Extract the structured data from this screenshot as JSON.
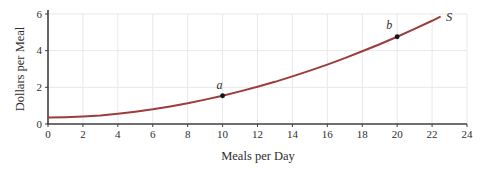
{
  "chart_data": {
    "type": "line",
    "title": "",
    "xlabel": "Meals per Day",
    "ylabel": "Dollars per Meal",
    "xlim": [
      0,
      24
    ],
    "ylim": [
      0,
      6
    ],
    "x_ticks": [
      0,
      2,
      4,
      6,
      8,
      10,
      12,
      14,
      16,
      18,
      20,
      22,
      24
    ],
    "y_ticks": [
      0,
      2,
      4,
      6
    ],
    "grid": true,
    "legend": "none",
    "series": [
      {
        "name": "supply-curve",
        "label": "S",
        "color": "#9c3c3c",
        "points": [
          [
            0,
            0.35
          ],
          [
            1,
            0.37
          ],
          [
            2,
            0.41
          ],
          [
            3,
            0.47
          ],
          [
            4,
            0.56
          ],
          [
            5,
            0.67
          ],
          [
            6,
            0.8
          ],
          [
            7,
            0.96
          ],
          [
            8,
            1.13
          ],
          [
            9,
            1.33
          ],
          [
            10,
            1.54
          ],
          [
            11,
            1.78
          ],
          [
            12,
            2.03
          ],
          [
            13,
            2.3
          ],
          [
            14,
            2.6
          ],
          [
            15,
            2.91
          ],
          [
            16,
            3.24
          ],
          [
            17,
            3.59
          ],
          [
            18,
            3.97
          ],
          [
            19,
            4.35
          ],
          [
            20,
            4.76
          ],
          [
            21,
            5.19
          ],
          [
            22,
            5.63
          ],
          [
            22.45,
            5.84
          ]
        ]
      }
    ],
    "annotations": [
      {
        "label": "a",
        "x": 10,
        "y": 1.54
      },
      {
        "label": "b",
        "x": 20,
        "y": 4.76
      }
    ],
    "colors": {
      "curve": "#9c3c3c",
      "axis": "#3f3f3f",
      "grid": "#e8e8e8",
      "text": "#2e2e2e",
      "point": "#151515"
    }
  }
}
